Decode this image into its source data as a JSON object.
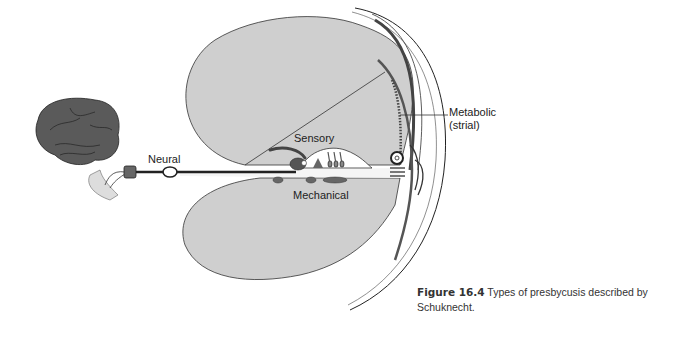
{
  "figure": {
    "number": "Figure 16.4",
    "caption": "Types of presbycusis described by Schuknecht.",
    "caption_line1": "Types of presbycusis described by",
    "caption_line2": "Schuknecht."
  },
  "labels": {
    "neural": "Neural",
    "sensory": "Sensory",
    "mechanical": "Mechanical",
    "metabolic_line1": "Metabolic",
    "metabolic_line2": "(strial)"
  },
  "colors": {
    "scala_fill": "#cfcfcf",
    "brain_fill": "#5a5a5a",
    "outline": "#222222",
    "background": "#ffffff"
  }
}
